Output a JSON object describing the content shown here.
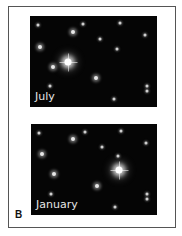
{
  "figure": {
    "letter": "B",
    "panels": [
      {
        "label": "July",
        "box": {
          "left": 30,
          "top": 16,
          "width": 127,
          "height": 91
        },
        "stars": [
          {
            "x": 38,
            "y": 25,
            "size": "s"
          },
          {
            "x": 73,
            "y": 32,
            "size": "m"
          },
          {
            "x": 83,
            "y": 24,
            "size": "s"
          },
          {
            "x": 120,
            "y": 23,
            "size": "s"
          },
          {
            "x": 145,
            "y": 35,
            "size": "s"
          },
          {
            "x": 40,
            "y": 47,
            "size": "m"
          },
          {
            "x": 100,
            "y": 39,
            "size": "s"
          },
          {
            "x": 117,
            "y": 49,
            "size": "s"
          },
          {
            "x": 68,
            "y": 62,
            "size": "b"
          },
          {
            "x": 53,
            "y": 67,
            "size": "m"
          },
          {
            "x": 96,
            "y": 78,
            "size": "m"
          },
          {
            "x": 50,
            "y": 86,
            "size": "s"
          },
          {
            "x": 147,
            "y": 86,
            "size": "s"
          },
          {
            "x": 147,
            "y": 91,
            "size": "s"
          },
          {
            "x": 114,
            "y": 99,
            "size": "s"
          }
        ]
      },
      {
        "label": "January",
        "box": {
          "left": 31,
          "top": 124,
          "width": 126,
          "height": 91
        },
        "stars": [
          {
            "x": 39,
            "y": 133,
            "size": "s"
          },
          {
            "x": 73,
            "y": 139,
            "size": "m"
          },
          {
            "x": 85,
            "y": 132,
            "size": "s"
          },
          {
            "x": 121,
            "y": 131,
            "size": "s"
          },
          {
            "x": 146,
            "y": 143,
            "size": "s"
          },
          {
            "x": 42,
            "y": 154,
            "size": "m"
          },
          {
            "x": 102,
            "y": 147,
            "size": "s"
          },
          {
            "x": 118,
            "y": 156,
            "size": "s"
          },
          {
            "x": 119,
            "y": 170,
            "size": "b"
          },
          {
            "x": 54,
            "y": 174,
            "size": "m"
          },
          {
            "x": 97,
            "y": 186,
            "size": "m"
          },
          {
            "x": 51,
            "y": 194,
            "size": "s"
          },
          {
            "x": 147,
            "y": 194,
            "size": "s"
          },
          {
            "x": 147,
            "y": 199,
            "size": "s"
          },
          {
            "x": 115,
            "y": 207,
            "size": "s"
          }
        ]
      }
    ]
  }
}
